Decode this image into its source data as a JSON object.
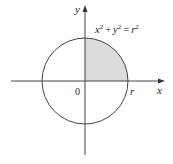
{
  "diagram": {
    "equation": "x² + y² = r²",
    "equation_parts": {
      "x": "x",
      "sup1": "2",
      "plus": "+",
      "y": "y",
      "sup2": "2",
      "eq": "=",
      "r": "r",
      "sup3": "2"
    },
    "labels": {
      "x_axis": "x",
      "y_axis": "y",
      "origin": "0",
      "radius_point": "r"
    },
    "shading": {
      "region": "first quadrant of circle",
      "color": "#dcdcdc"
    },
    "colors": {
      "stroke": "#333333",
      "fill": "#dcdcdc"
    }
  }
}
